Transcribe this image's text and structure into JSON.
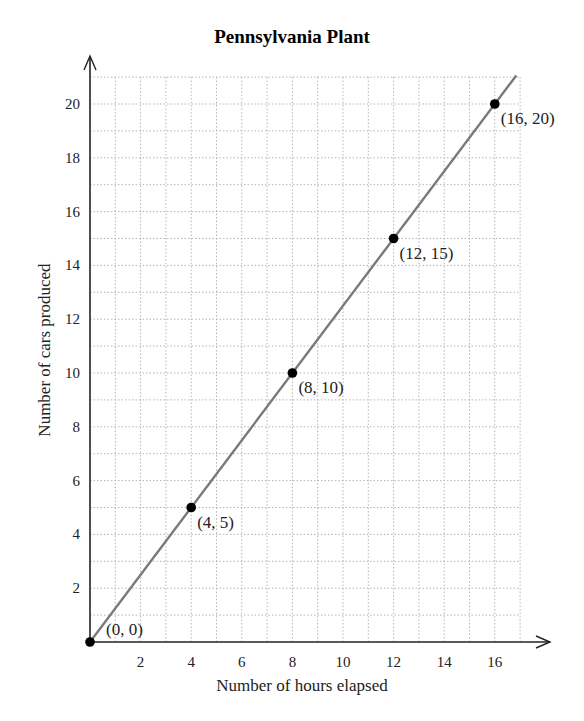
{
  "chart_data": {
    "type": "line",
    "title": "Pennsylvania Plant",
    "xlabel": "Number of hours elapsed",
    "ylabel": "Number of cars produced",
    "x": [
      0,
      4,
      8,
      12,
      16
    ],
    "series": [
      {
        "name": "Cars produced",
        "values": [
          0,
          5,
          10,
          15,
          20
        ]
      }
    ],
    "point_labels": [
      "(0, 0)",
      "(4, 5)",
      "(8, 10)",
      "(12, 15)",
      "(16, 20)"
    ],
    "xticks": [
      2,
      4,
      6,
      8,
      10,
      12,
      14,
      16
    ],
    "yticks": [
      2,
      4,
      6,
      8,
      10,
      12,
      14,
      16,
      18,
      20
    ],
    "xlim": [
      0,
      17
    ],
    "ylim": [
      0,
      21
    ],
    "grid": true,
    "grid_step": 1,
    "line_color": "#7a7a7a",
    "point_color": "#000000",
    "grid_color": "#b5b5b5"
  }
}
